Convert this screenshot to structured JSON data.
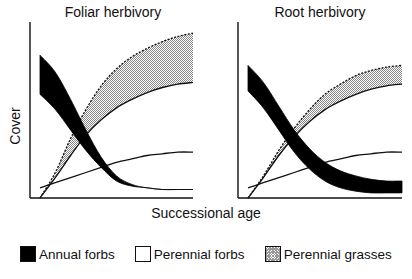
{
  "chart_data": {
    "type": "area",
    "xlabel": "Successional age",
    "ylabel": "Cover",
    "axis_ticks": "none",
    "grid": false,
    "legend_placement": "bottom",
    "legend": [
      {
        "name": "Annual forbs",
        "style": "solid-black"
      },
      {
        "name": "Perennial forbs",
        "style": "white"
      },
      {
        "name": "Perennial grasses",
        "style": "stippled"
      }
    ],
    "x": [
      0,
      0.1,
      0.2,
      0.3,
      0.4,
      0.5,
      0.6,
      0.7,
      0.8,
      0.9,
      1.0
    ],
    "panels": [
      {
        "title": "Foliar herbivory",
        "series": [
          {
            "name": "Annual forbs (upper)",
            "values": [
              0.84,
              0.74,
              0.58,
              0.4,
              0.24,
              0.13,
              0.08,
              0.06,
              0.05,
              0.05,
              0.05
            ]
          },
          {
            "name": "Annual forbs (lower)",
            "values": [
              0.61,
              0.52,
              0.4,
              0.28,
              0.18,
              0.1,
              0.07,
              0.06,
              0.05,
              0.05,
              0.05
            ]
          },
          {
            "name": "Perennial forbs",
            "values": [
              0.06,
              0.09,
              0.12,
              0.15,
              0.18,
              0.21,
              0.23,
              0.25,
              0.26,
              0.27,
              0.27
            ]
          },
          {
            "name": "Perennial grasses (lower)",
            "values": [
              0.0,
              0.12,
              0.25,
              0.37,
              0.46,
              0.53,
              0.58,
              0.62,
              0.65,
              0.67,
              0.68
            ]
          },
          {
            "name": "Perennial grasses (upper)",
            "values": [
              0.0,
              0.15,
              0.35,
              0.52,
              0.66,
              0.76,
              0.83,
              0.88,
              0.92,
              0.95,
              0.97
            ]
          }
        ]
      },
      {
        "title": "Root herbivory",
        "series": [
          {
            "name": "Annual forbs (upper)",
            "values": [
              0.78,
              0.68,
              0.54,
              0.4,
              0.29,
              0.21,
              0.16,
              0.13,
              0.11,
              0.1,
              0.1
            ]
          },
          {
            "name": "Annual forbs (lower)",
            "values": [
              0.63,
              0.53,
              0.4,
              0.27,
              0.17,
              0.1,
              0.06,
              0.04,
              0.03,
              0.03,
              0.03
            ]
          },
          {
            "name": "Perennial forbs",
            "values": [
              0.06,
              0.09,
              0.12,
              0.15,
              0.18,
              0.21,
              0.23,
              0.25,
              0.26,
              0.27,
              0.27
            ]
          },
          {
            "name": "Perennial grasses (lower)",
            "values": [
              0.0,
              0.12,
              0.25,
              0.36,
              0.45,
              0.52,
              0.57,
              0.61,
              0.64,
              0.66,
              0.67
            ]
          },
          {
            "name": "Perennial grasses (upper)",
            "values": [
              0.0,
              0.13,
              0.28,
              0.41,
              0.52,
              0.61,
              0.67,
              0.72,
              0.75,
              0.77,
              0.78
            ]
          }
        ]
      }
    ],
    "ylim": [
      0,
      1
    ],
    "xlim": [
      0,
      1
    ]
  }
}
